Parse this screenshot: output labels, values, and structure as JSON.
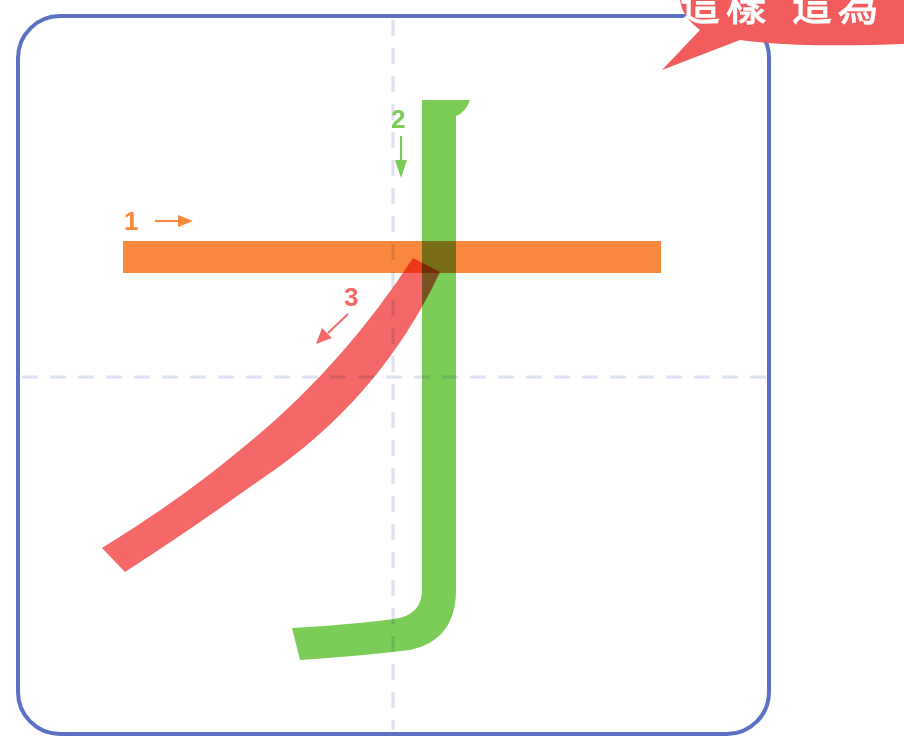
{
  "diagram": {
    "type": "stroke-order",
    "character": "才",
    "frame": {
      "border_color": "#5b72c4",
      "guide_color": "#d9dff2"
    },
    "speech_bubble": {
      "text_partial": "這樣  這為",
      "color": "#f25c5c",
      "text_color": "#ffffff"
    },
    "strokes": [
      {
        "order": 1,
        "label": "1",
        "direction": "right",
        "name": "horizontal",
        "color": "#f7883c"
      },
      {
        "order": 2,
        "label": "2",
        "direction": "down",
        "name": "vertical-hook",
        "color": "#7ccc58"
      },
      {
        "order": 3,
        "label": "3",
        "direction": "down-left",
        "name": "left-falling",
        "color": "#f56868"
      }
    ]
  }
}
